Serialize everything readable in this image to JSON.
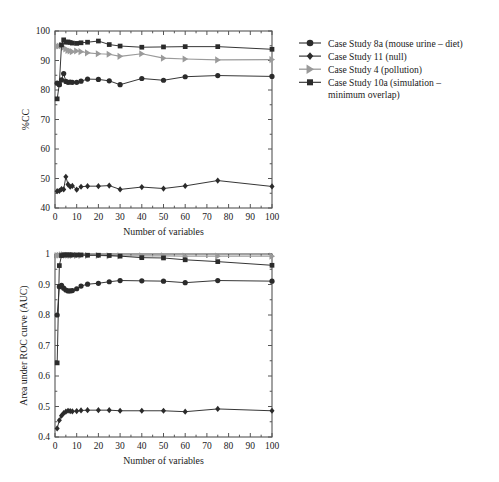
{
  "figure": {
    "background": "#ffffff",
    "line_color_dark": "#2b2b2b",
    "line_color_gray": "#9a9a9a",
    "axis_color": "#555555"
  },
  "legend": {
    "position": "right",
    "entries": [
      {
        "label": "Case Study 8a (mouse urine – diet)",
        "marker": "circle",
        "color": "#2b2b2b"
      },
      {
        "label": "Case Study 11 (null)",
        "marker": "diamond",
        "color": "#2b2b2b"
      },
      {
        "label": "Case Study 4 (pollution)",
        "marker": "triangle-right",
        "color": "#9a9a9a"
      },
      {
        "label": "Case Study 10a (simulation –",
        "label2": "minimum overlap)",
        "marker": "square",
        "color": "#2b2b2b"
      }
    ]
  },
  "chart_data": [
    {
      "type": "line",
      "panel": "top",
      "title": "",
      "xlabel": "Number of variables",
      "ylabel": "%CC",
      "xlim": [
        0,
        100
      ],
      "ylim": [
        40,
        100
      ],
      "xticks": [
        0,
        10,
        20,
        30,
        40,
        50,
        60,
        70,
        80,
        90,
        100
      ],
      "yticks": [
        40,
        50,
        60,
        70,
        80,
        90,
        100
      ],
      "xtick_labels": [
        "0",
        "10",
        "20",
        "30",
        "40",
        "50",
        "60",
        "70",
        "80",
        "90",
        "100"
      ],
      "ytick_labels": [
        "40",
        "50",
        "60",
        "70",
        "80",
        "90",
        "100"
      ],
      "grid": false,
      "series": [
        {
          "name": "Case Study 8a (mouse urine – diet)",
          "marker": "circle",
          "color": "#2b2b2b",
          "x": [
            1,
            2,
            3,
            4,
            5,
            6,
            7,
            8,
            10,
            12,
            15,
            20,
            25,
            30,
            40,
            50,
            60,
            75,
            100
          ],
          "y": [
            82.3,
            81.8,
            83.4,
            85.6,
            82.9,
            82.6,
            82.7,
            82.6,
            82.6,
            83.0,
            83.7,
            83.6,
            83.1,
            81.8,
            83.9,
            83.3,
            84.5,
            84.9,
            84.6
          ]
        },
        {
          "name": "Case Study 11 (null)",
          "marker": "diamond",
          "color": "#2b2b2b",
          "x": [
            1,
            2,
            3,
            4,
            5,
            6,
            7,
            8,
            10,
            12,
            15,
            20,
            25,
            30,
            40,
            50,
            60,
            75,
            100
          ],
          "y": [
            45.7,
            45.8,
            46.4,
            46.3,
            50.6,
            48.0,
            47.2,
            47.5,
            46.2,
            47.2,
            47.4,
            47.4,
            47.6,
            46.3,
            47.1,
            46.6,
            47.5,
            49.3,
            47.3
          ]
        },
        {
          "name": "Case Study 4 (pollution)",
          "marker": "triangle-right",
          "color": "#9a9a9a",
          "x": [
            1,
            2,
            3,
            4,
            5,
            6,
            7,
            8,
            10,
            12,
            15,
            20,
            25,
            30,
            40,
            50,
            60,
            75,
            100
          ],
          "y": [
            94.8,
            94.9,
            95.0,
            94.4,
            93.9,
            93.4,
            93.2,
            93.0,
            93.2,
            93.0,
            92.6,
            92.3,
            92.1,
            91.4,
            92.3,
            90.8,
            90.5,
            90.2,
            90.3
          ]
        },
        {
          "name": "Case Study 10a (simulation – minimum overlap)",
          "marker": "square",
          "color": "#2b2b2b",
          "x": [
            1,
            2,
            3,
            4,
            5,
            6,
            7,
            8,
            10,
            12,
            15,
            20,
            25,
            30,
            40,
            50,
            60,
            75,
            100
          ],
          "y": [
            77.0,
            82.0,
            95.3,
            97.0,
            96.2,
            96.3,
            96.1,
            95.9,
            95.8,
            96.0,
            96.2,
            96.6,
            95.4,
            94.9,
            94.5,
            94.6,
            94.7,
            94.7,
            93.8
          ]
        }
      ]
    },
    {
      "type": "line",
      "panel": "bottom",
      "title": "",
      "xlabel": "Number of variables",
      "ylabel": "Area under ROC curve (AUC)",
      "xlim": [
        0,
        100
      ],
      "ylim": [
        0.4,
        1.0
      ],
      "xticks": [
        0,
        10,
        20,
        30,
        40,
        50,
        60,
        70,
        80,
        90,
        100
      ],
      "yticks": [
        0.4,
        0.5,
        0.6,
        0.7,
        0.8,
        0.9,
        1.0
      ],
      "xtick_labels": [
        "0",
        "10",
        "20",
        "30",
        "40",
        "50",
        "60",
        "70",
        "80",
        "90",
        "100"
      ],
      "ytick_labels": [
        "0.4",
        "0.5",
        "0.6",
        "0.7",
        "0.8",
        "0.9",
        "1"
      ],
      "grid": false,
      "series": [
        {
          "name": "Case Study 8a (mouse urine – diet)",
          "marker": "circle",
          "color": "#2b2b2b",
          "x": [
            1,
            2,
            3,
            4,
            5,
            6,
            7,
            8,
            10,
            12,
            15,
            20,
            25,
            30,
            40,
            50,
            60,
            75,
            100
          ],
          "y": [
            0.8,
            0.893,
            0.897,
            0.888,
            0.882,
            0.879,
            0.879,
            0.88,
            0.886,
            0.895,
            0.901,
            0.904,
            0.909,
            0.913,
            0.912,
            0.911,
            0.906,
            0.913,
            0.911
          ]
        },
        {
          "name": "Case Study 11 (null)",
          "marker": "diamond",
          "color": "#2b2b2b",
          "x": [
            1,
            2,
            3,
            4,
            5,
            6,
            7,
            8,
            10,
            12,
            15,
            20,
            25,
            30,
            40,
            50,
            60,
            75,
            100
          ],
          "y": [
            0.428,
            0.455,
            0.47,
            0.478,
            0.483,
            0.486,
            0.485,
            0.484,
            0.485,
            0.487,
            0.488,
            0.488,
            0.488,
            0.486,
            0.486,
            0.486,
            0.483,
            0.492,
            0.486
          ]
        },
        {
          "name": "Case Study 4 (pollution)",
          "marker": "triangle-right",
          "color": "#9a9a9a",
          "x": [
            1,
            2,
            3,
            4,
            5,
            6,
            7,
            8,
            10,
            12,
            15,
            20,
            25,
            30,
            40,
            50,
            60,
            75,
            100
          ],
          "y": [
            0.995,
            0.996,
            0.997,
            0.997,
            0.996,
            0.996,
            0.995,
            0.995,
            0.995,
            0.995,
            0.995,
            0.995,
            0.994,
            0.994,
            0.994,
            0.994,
            0.993,
            0.993,
            0.993
          ]
        },
        {
          "name": "Case Study 10a (simulation – minimum overlap)",
          "marker": "square",
          "color": "#2b2b2b",
          "x": [
            1,
            2,
            3,
            4,
            5,
            6,
            7,
            8,
            10,
            12,
            15,
            20,
            25,
            30,
            40,
            50,
            60,
            75,
            100
          ],
          "y": [
            0.643,
            0.962,
            0.995,
            0.997,
            0.997,
            0.997,
            0.997,
            0.997,
            0.997,
            0.997,
            0.996,
            0.996,
            0.995,
            0.993,
            0.988,
            0.987,
            0.981,
            0.975,
            0.963
          ]
        }
      ]
    }
  ]
}
